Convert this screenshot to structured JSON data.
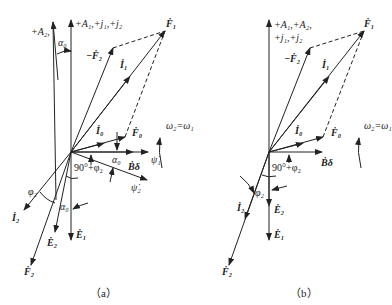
{
  "figure_a": {
    "caption": "（a）",
    "labels": {
      "A2_axis": "+A₂,",
      "A1_axis": "+A₁,+j₁,+j₂",
      "alpha0_top": "α₀",
      "neg_F2": "−Ḟ₂",
      "I1": "İ₁",
      "F1": "Ḟ₁",
      "I0": "İ₀",
      "F0": "Ḟ₀",
      "omega": "ω₂=ω₁",
      "alpha0_mid": "α₀",
      "B_delta": "Ḃδ",
      "psi1": "ψ̇₁",
      "angle_90": "90°+φ₂",
      "psi2": "ψ̇₂",
      "phi2": "φ₂",
      "alpha0_low": "α₀",
      "I2": "İ₂",
      "E2": "Ė₂",
      "E1": "Ė₁",
      "F2": "Ḟ₂"
    }
  },
  "figure_b": {
    "caption": "（b）",
    "labels": {
      "axis_line1": "+A₁,+A₂,",
      "axis_line2": "+j₁,+j₂",
      "F1": "Ḟ₁",
      "neg_F2": "−Ḟ₂",
      "I1": "İ₁",
      "I0": "İ₀",
      "F0": "Ḟ₀",
      "omega": "ω₂=ω₁",
      "angle_90": "90°+φ₂",
      "B_delta": "Ḃδ",
      "phi2": "φ₂",
      "I2": "İ₂",
      "E2": "Ė₂",
      "E1": "Ė₁",
      "F2": "Ḟ₂"
    }
  }
}
